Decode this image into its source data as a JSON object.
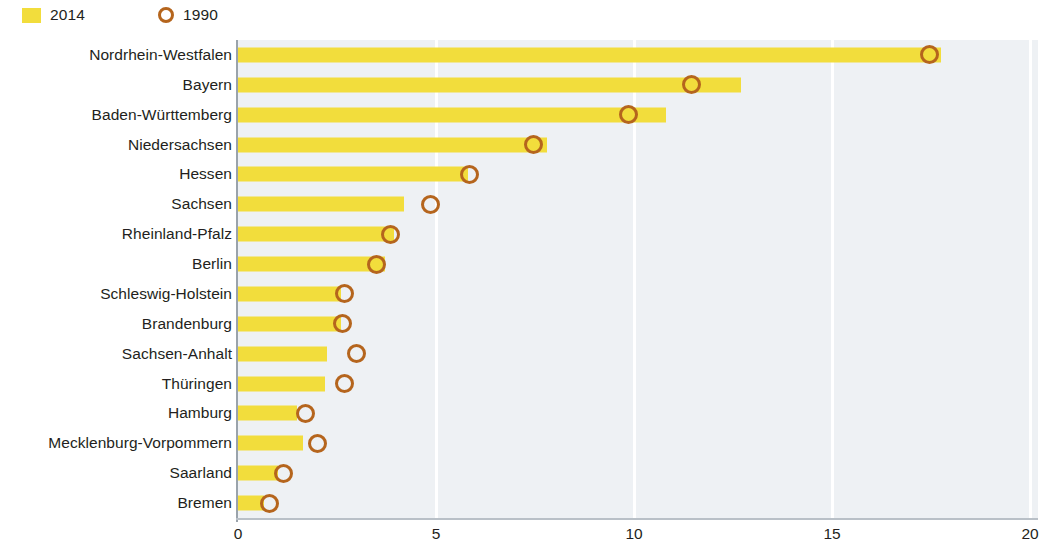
{
  "legend": {
    "items": [
      {
        "label": "2014",
        "marker": "square-swatch-icon",
        "color": "#f2dd3c"
      },
      {
        "label": "1990",
        "marker": "circle-outline-icon",
        "color": "#b5651d"
      }
    ]
  },
  "axis": {
    "x_ticks": [
      "0",
      "5",
      "10",
      "15",
      "20"
    ]
  },
  "chart_data": {
    "type": "bar",
    "title": "",
    "subtitle": "",
    "xlabel": "",
    "ylabel": "",
    "xlim": [
      0,
      20
    ],
    "grid": true,
    "grid_axis": "x",
    "orientation": "horizontal",
    "legend_position": "top-left",
    "categories": [
      "Nordrhein-Westfalen",
      "Bayern",
      "Baden-Württemberg",
      "Niedersachsen",
      "Hessen",
      "Sachsen",
      "Rheinland-Pfalz",
      "Berlin",
      "Schleswig-Holstein",
      "Brandenburg",
      "Sachsen-Anhalt",
      "Thüringen",
      "Hamburg",
      "Mecklenburg-Vorpommern",
      "Saarland",
      "Bremen"
    ],
    "series": [
      {
        "name": "2014",
        "type": "bar",
        "color": "#f2dd3c",
        "values": [
          17.75,
          12.7,
          10.8,
          7.8,
          5.8,
          4.2,
          3.95,
          3.7,
          2.6,
          2.6,
          2.25,
          2.2,
          1.5,
          1.65,
          1.0,
          0.65
        ]
      },
      {
        "name": "1990",
        "type": "marker",
        "color": "#b5651d",
        "values": [
          17.45,
          11.45,
          9.85,
          7.45,
          5.85,
          4.85,
          3.85,
          3.5,
          2.7,
          2.65,
          3.0,
          2.7,
          1.7,
          2.0,
          1.15,
          0.8
        ]
      }
    ]
  }
}
